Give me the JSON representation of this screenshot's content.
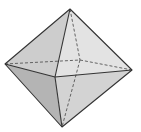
{
  "diagram": {
    "title": "",
    "shape": "octahedron",
    "vertices": {
      "top": [
        70,
        9
      ],
      "left": [
        5,
        64
      ],
      "right": [
        132,
        70
      ],
      "bottom": [
        62,
        127
      ],
      "front": [
        55,
        77
      ],
      "back": [
        80,
        60
      ]
    },
    "colors": {
      "background": "#ffffff",
      "edge": "#3a3a3a",
      "face_top_left": "#cfcfcf",
      "face_top_right": "#e2e2e2",
      "face_bottom_left": "#b5b5b5",
      "face_bottom_right": "#d2d2d2"
    }
  }
}
